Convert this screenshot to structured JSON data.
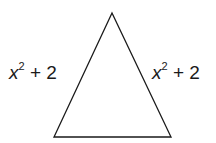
{
  "diagram": {
    "shape": "isosceles-triangle",
    "stroke_color": "#1a1a1a",
    "vertices": {
      "apex": [
        112,
        13
      ],
      "bottom_left": [
        54,
        137
      ],
      "bottom_right": [
        171,
        137
      ]
    },
    "left_side": {
      "var": "x",
      "exp": "2",
      "rest": "+ 2"
    },
    "right_side": {
      "var": "x",
      "exp": "2",
      "rest": "+ 2"
    }
  }
}
